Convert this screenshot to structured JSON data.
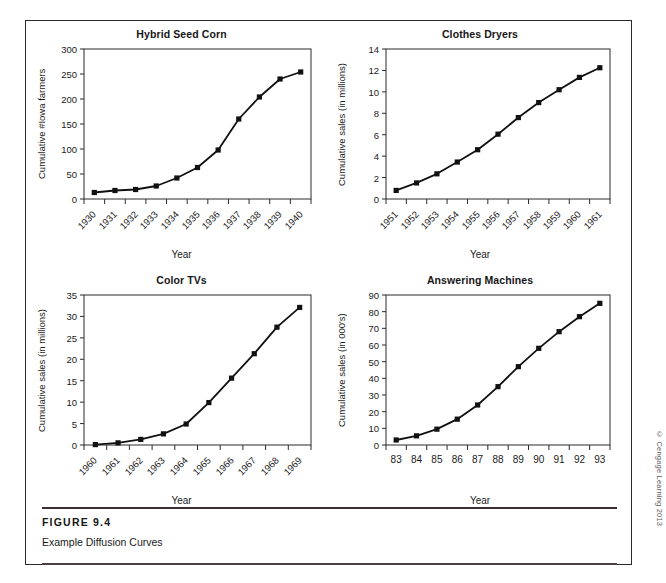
{
  "figure": {
    "number_label": "FIGURE 9.4",
    "caption": "Example Diffusion Curves",
    "copyright": "© Cengage Learning 2013"
  },
  "chart_data": [
    {
      "type": "line",
      "title": "Hybrid Seed Corn",
      "xlabel": "Year",
      "ylabel": "Cumulative #Iowa farmers",
      "categories": [
        "1930",
        "1931",
        "1932",
        "1933",
        "1934",
        "1935",
        "1936",
        "1937",
        "1938",
        "1939",
        "1940"
      ],
      "values": [
        13,
        17,
        19,
        26,
        42,
        63,
        98,
        160,
        204,
        240,
        254
      ],
      "yticks": [
        0,
        50,
        100,
        150,
        200,
        250,
        300
      ],
      "ylim": [
        0,
        300
      ],
      "grid": false,
      "legend": "none",
      "xtick_rotation": -45,
      "marker": "square",
      "series_color": "#111111"
    },
    {
      "type": "line",
      "title": "Clothes Dryers",
      "xlabel": "Year",
      "ylabel": "Cumulative sales (in millions)",
      "categories": [
        "1951",
        "1952",
        "1953",
        "1954",
        "1955",
        "1956",
        "1957",
        "1958",
        "1959",
        "1960",
        "1961"
      ],
      "values": [
        0.8,
        1.5,
        2.35,
        3.45,
        4.6,
        6.05,
        7.6,
        9.0,
        10.2,
        11.35,
        12.25
      ],
      "yticks": [
        0,
        2,
        4,
        6,
        8,
        10,
        12,
        14
      ],
      "ylim": [
        0,
        14
      ],
      "grid": false,
      "legend": "none",
      "xtick_rotation": -45,
      "marker": "square",
      "series_color": "#111111"
    },
    {
      "type": "line",
      "title": "Color TVs",
      "xlabel": "Year",
      "ylabel": "Cumulative sales (in millions)",
      "categories": [
        "1960",
        "1961",
        "1962",
        "1963",
        "1964",
        "1965",
        "1966",
        "1967",
        "1968",
        "1969"
      ],
      "values": [
        0.1,
        0.5,
        1.3,
        2.6,
        4.9,
        9.9,
        15.6,
        21.3,
        27.5,
        32.1
      ],
      "yticks": [
        0,
        5,
        10,
        15,
        20,
        25,
        30,
        35
      ],
      "ylim": [
        0,
        35
      ],
      "grid": false,
      "legend": "none",
      "xtick_rotation": -45,
      "marker": "square",
      "series_color": "#111111"
    },
    {
      "type": "line",
      "title": "Answering Machines",
      "xlabel": "Year",
      "ylabel": "Cumulative sales (in 000's)",
      "categories": [
        "83",
        "84",
        "85",
        "86",
        "87",
        "88",
        "89",
        "90",
        "91",
        "92",
        "93"
      ],
      "values": [
        3,
        5.5,
        9.5,
        15.5,
        24,
        35,
        47,
        58,
        68,
        77,
        85
      ],
      "yticks": [
        0,
        10,
        20,
        30,
        40,
        50,
        60,
        70,
        80,
        90
      ],
      "ylim": [
        0,
        90
      ],
      "grid": false,
      "legend": "none",
      "xtick_rotation": 0,
      "marker": "square",
      "series_color": "#111111"
    }
  ]
}
